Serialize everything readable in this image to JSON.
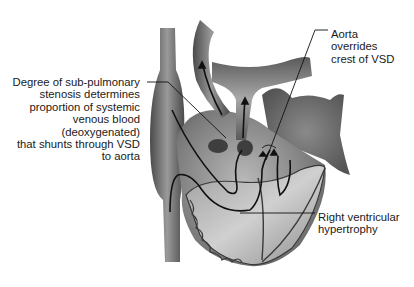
{
  "figure": {
    "labels": {
      "sub_pulmonary": {
        "lines": [
          "Degree of sub-pulmonary",
          "stenosis determines",
          "proportion of systemic",
          "venous blood",
          "(deoxygenated)",
          "that shunts through VSD",
          "to aorta"
        ]
      },
      "aorta": {
        "lines": [
          "Aorta",
          "overrides",
          "crest of VSD"
        ]
      },
      "rvh": {
        "lines": [
          "Right ventricular",
          "hypertrophy"
        ]
      }
    },
    "colors": {
      "background": "#ffffff",
      "tissue_dark": "#5a5a5a",
      "tissue_mid": "#8a8a8a",
      "tissue_light": "#c8c8c8",
      "text": "#1a1a1a",
      "leader": "#111111"
    }
  }
}
